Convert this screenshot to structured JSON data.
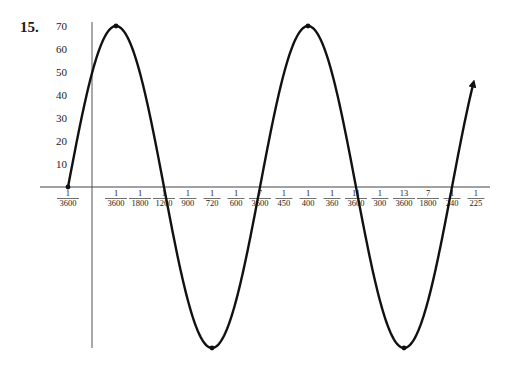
{
  "problem": {
    "number": "15."
  },
  "chart_data": {
    "type": "line",
    "title": "",
    "xlabel": "",
    "ylabel": "",
    "function": "y = 70 sin(900π (t + 1/3600))",
    "amplitude": 70,
    "period": "1/450",
    "y_ticks": [
      10,
      20,
      30,
      40,
      50,
      60,
      70
    ],
    "x_ticks": [
      {
        "num": "1",
        "den": "3600",
        "value": -0.000277778,
        "negative": true
      },
      {
        "num": "1",
        "den": "3600",
        "value": 0.000277778
      },
      {
        "num": "1",
        "den": "1800",
        "value": 0.000555556
      },
      {
        "num": "1",
        "den": "1200",
        "value": 0.000833333
      },
      {
        "num": "1",
        "den": "900",
        "value": 0.001111111
      },
      {
        "num": "1",
        "den": "720",
        "value": 0.001388889
      },
      {
        "num": "1",
        "den": "600",
        "value": 0.001666667
      },
      {
        "num": "7",
        "den": "3600",
        "value": 0.001944444
      },
      {
        "num": "1",
        "den": "450",
        "value": 0.002222222
      },
      {
        "num": "1",
        "den": "400",
        "value": 0.0025
      },
      {
        "num": "1",
        "den": "360",
        "value": 0.002777778
      },
      {
        "num": "11",
        "den": "3600",
        "value": 0.003055556
      },
      {
        "num": "1",
        "den": "300",
        "value": 0.003333333
      },
      {
        "num": "13",
        "den": "3600",
        "value": 0.003611111
      },
      {
        "num": "7",
        "den": "1800",
        "value": 0.003888889
      },
      {
        "num": "1",
        "den": "240",
        "value": 0.004166667
      },
      {
        "num": "1",
        "den": "225",
        "value": 0.004444444
      }
    ],
    "key_points": [
      {
        "t": "-1/3600",
        "y": 0
      },
      {
        "t": "1/3600",
        "y": 70
      },
      {
        "t": "1/1200",
        "y": 0
      },
      {
        "t": "1/720",
        "y": -70
      },
      {
        "t": "7/3600",
        "y": 0
      },
      {
        "t": "1/400",
        "y": 70
      },
      {
        "t": "11/3600",
        "y": 0
      },
      {
        "t": "13/3600",
        "y": -70
      },
      {
        "t": "1/240",
        "y": 0
      }
    ],
    "x_range_units_of_1_3600": [
      -1,
      16
    ],
    "ylim": [
      -70,
      70
    ],
    "grid": false,
    "legend": null,
    "end_arrow": true
  }
}
